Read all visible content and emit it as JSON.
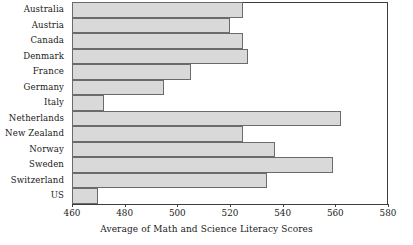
{
  "chart_data": {
    "type": "bar",
    "orientation": "horizontal",
    "title": "",
    "xlabel": "Average of Math and Science Literacy Scores",
    "ylabel": "",
    "categories": [
      "Australia",
      "Austria",
      "Canada",
      "Denmark",
      "France",
      "Germany",
      "Italy",
      "Netherlands",
      "New Zealand",
      "Norway",
      "Sweden",
      "Switzerland",
      "US"
    ],
    "values": [
      525,
      520,
      525,
      527,
      505,
      495,
      472,
      562,
      525,
      537,
      559,
      534,
      470
    ],
    "xlim": [
      460,
      580
    ],
    "xticks": [
      460,
      480,
      500,
      520,
      540,
      560,
      580
    ],
    "xtick_labels": [
      "460",
      "480",
      "500",
      "520",
      "540",
      "560",
      "580"
    ],
    "grid": false,
    "legend": false,
    "bar_fill_color": "#d9d9d9",
    "bar_border_color": "#6b6b6b",
    "axis_color": "#3d3d3d"
  }
}
